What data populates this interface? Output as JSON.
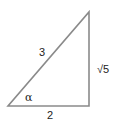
{
  "diagram": {
    "type": "right-triangle",
    "line_color": "#8a8a8a",
    "vertices": {
      "left": [
        8,
        106
      ],
      "right_bottom": [
        89,
        106
      ],
      "top": [
        89,
        12
      ]
    },
    "labels": {
      "hypotenuse": "3",
      "vertical_side": "√5",
      "base": "2",
      "angle": "α"
    }
  }
}
